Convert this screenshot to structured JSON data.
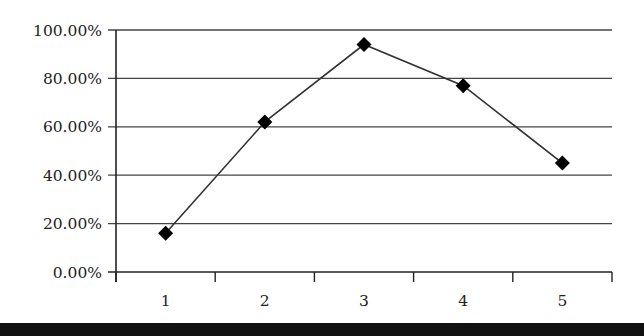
{
  "chart_data": {
    "type": "line",
    "title": "",
    "xlabel": "",
    "ylabel": "",
    "categories": [
      "1",
      "2",
      "3",
      "4",
      "5"
    ],
    "series": [
      {
        "name": "Series 1",
        "values": [
          0.16,
          0.62,
          0.94,
          0.77,
          0.45
        ],
        "marker": "diamond",
        "color": "#000000"
      }
    ],
    "ylim": [
      0,
      1
    ],
    "y_ticks": [
      0,
      0.2,
      0.4,
      0.6,
      0.8,
      1.0
    ],
    "y_tick_labels": [
      "0.00%",
      "20.00%",
      "40.00%",
      "60.00%",
      "80.00%",
      "100.00%"
    ],
    "grid": true,
    "legend": "none"
  },
  "style": {
    "line_color": "#333333",
    "grid_color": "#444444",
    "axis_color": "#222222",
    "marker_color": "#000000",
    "footer_bar_color": "#111111"
  }
}
